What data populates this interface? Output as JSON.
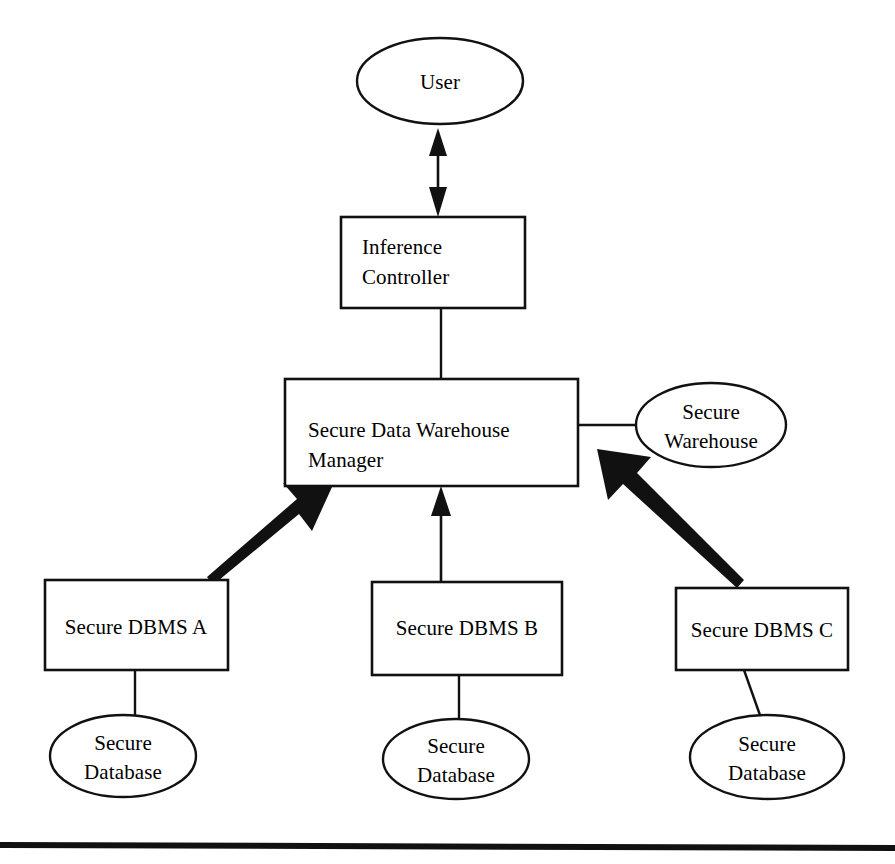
{
  "diagram": {
    "type": "block-diagram",
    "canvas": {
      "width": 895,
      "height": 864
    },
    "colors": {
      "background": "#ffffff",
      "stroke": "#111111",
      "fill": "#ffffff",
      "text": "#000000"
    },
    "nodes": [
      {
        "id": "user",
        "label": "User",
        "shape": "ellipse",
        "cx": 440,
        "cy": 81,
        "rx": 83,
        "ry": 43,
        "lines": [
          "User"
        ],
        "align": "center"
      },
      {
        "id": "inference-controller",
        "label": "Inference Controller",
        "shape": "rect",
        "x": 341,
        "y": 217,
        "w": 184,
        "h": 91,
        "lines": [
          "Inference",
          "Controller"
        ],
        "align": "left"
      },
      {
        "id": "secure-data-warehouse-manager",
        "label": "Secure Data Warehouse Manager",
        "shape": "rect",
        "x": 285,
        "y": 379,
        "w": 293,
        "h": 107,
        "lines": [
          "Secure Data Warehouse",
          "Manager"
        ],
        "align": "left"
      },
      {
        "id": "secure-warehouse",
        "label": "Secure Warehouse",
        "shape": "ellipse",
        "cx": 711,
        "cy": 425,
        "rx": 75,
        "ry": 42,
        "lines": [
          "Secure",
          "Warehouse"
        ],
        "align": "center"
      },
      {
        "id": "secure-dbms-a",
        "label": "Secure DBMS A",
        "shape": "rect",
        "x": 45,
        "y": 580,
        "w": 183,
        "h": 90,
        "lines": [
          "Secure DBMS A"
        ],
        "align": "center"
      },
      {
        "id": "secure-dbms-b",
        "label": "Secure DBMS B",
        "shape": "rect",
        "x": 372,
        "y": 582,
        "w": 190,
        "h": 93,
        "lines": [
          "Secure DBMS B"
        ],
        "align": "center"
      },
      {
        "id": "secure-dbms-c",
        "label": "Secure DBMS C",
        "shape": "rect",
        "x": 676,
        "y": 588,
        "w": 172,
        "h": 82,
        "lines": [
          "Secure DBMS C"
        ],
        "align": "center"
      },
      {
        "id": "secure-database-a",
        "label": "Secure Database",
        "shape": "ellipse",
        "cx": 123,
        "cy": 756,
        "rx": 73,
        "ry": 41,
        "lines": [
          "Secure",
          "Database"
        ],
        "align": "center"
      },
      {
        "id": "secure-database-b",
        "label": "Secure Database",
        "shape": "ellipse",
        "cx": 456,
        "cy": 759,
        "rx": 73,
        "ry": 40,
        "lines": [
          "Secure",
          "Database"
        ],
        "align": "center"
      },
      {
        "id": "secure-database-c",
        "label": "Secure Database",
        "shape": "ellipse",
        "cx": 767,
        "cy": 757,
        "rx": 77,
        "ry": 42,
        "lines": [
          "Secure",
          "Database"
        ],
        "align": "center"
      }
    ],
    "edges": [
      {
        "id": "user-to-controller",
        "from": "user",
        "to": "inference-controller",
        "style": "double-arrow-vertical"
      },
      {
        "id": "controller-to-manager",
        "from": "inference-controller",
        "to": "secure-data-warehouse-manager",
        "style": "plain-line"
      },
      {
        "id": "manager-to-warehouse",
        "from": "secure-data-warehouse-manager",
        "to": "secure-warehouse",
        "style": "plain-line"
      },
      {
        "id": "dbms-a-to-manager",
        "from": "secure-dbms-a",
        "to": "secure-data-warehouse-manager",
        "style": "thick-arrow"
      },
      {
        "id": "dbms-b-to-manager",
        "from": "secure-dbms-b",
        "to": "secure-data-warehouse-manager",
        "style": "thin-arrow-vertical"
      },
      {
        "id": "dbms-c-to-manager",
        "from": "secure-dbms-c",
        "to": "secure-data-warehouse-manager",
        "style": "thick-arrow"
      },
      {
        "id": "dbms-a-to-database-a",
        "from": "secure-dbms-a",
        "to": "secure-database-a",
        "style": "plain-line"
      },
      {
        "id": "dbms-b-to-database-b",
        "from": "secure-dbms-b",
        "to": "secure-database-b",
        "style": "plain-line"
      },
      {
        "id": "dbms-c-to-database-c",
        "from": "secure-dbms-c",
        "to": "secure-database-c",
        "style": "plain-line"
      }
    ],
    "footer_rule": {
      "present": true,
      "y": 845,
      "thickness": 6
    }
  }
}
